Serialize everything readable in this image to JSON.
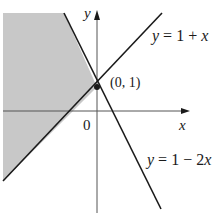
{
  "figure": {
    "axes": {
      "x_label": "x",
      "y_label": "y",
      "origin_label": "0"
    },
    "lines": [
      {
        "label_var": "y",
        "label_eq": " = 1 + ",
        "label_tail": "x",
        "equation": "y = 1 + x"
      },
      {
        "label_var": "y",
        "label_eq": " = 1 − 2",
        "label_tail": "x",
        "equation": "y = 1 - 2x"
      }
    ],
    "point": {
      "label": "(0, 1)",
      "x": 0,
      "y": 1
    },
    "shaded_region": {
      "description": "y >= 1 + x and y >= 1 - 2x (left region)",
      "color": "#c8c8c8"
    },
    "colors": {
      "line": "#1a1a1a",
      "axis": "#555555",
      "shade": "#c8c8c8"
    }
  }
}
